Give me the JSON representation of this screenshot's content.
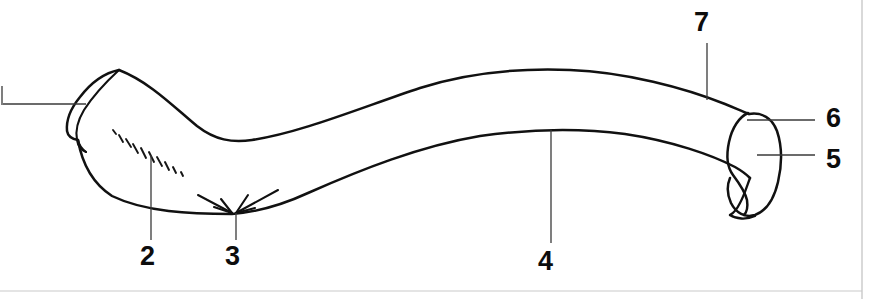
{
  "figure": {
    "kind": "anatomical-line-drawing",
    "background_color": "#ffffff",
    "outline_color": "#111111",
    "leader_color": "#3a3a3a",
    "frame_color": "#c9c9c9",
    "width": 883,
    "height": 299
  },
  "callouts": [
    {
      "id": "1",
      "label": "",
      "x": 0,
      "y": 88,
      "leader": "horizontal",
      "visible_number": false
    },
    {
      "id": "2",
      "label": "2",
      "x": 140,
      "y": 243,
      "leader": "vertical",
      "visible_number": true
    },
    {
      "id": "3",
      "label": "3",
      "x": 225,
      "y": 243,
      "leader": "vertical",
      "visible_number": true
    },
    {
      "id": "4",
      "label": "4",
      "x": 538,
      "y": 248,
      "leader": "vertical",
      "visible_number": true
    },
    {
      "id": "5",
      "label": "5",
      "x": 826,
      "y": 146,
      "leader": "horizontal",
      "visible_number": true
    },
    {
      "id": "6",
      "label": "6",
      "x": 826,
      "y": 105,
      "leader": "horizontal",
      "visible_number": true
    },
    {
      "id": "7",
      "label": "7",
      "x": 694,
      "y": 9,
      "leader": "vertical",
      "visible_number": true
    }
  ],
  "annotations": {
    "hatch_group_count": 9,
    "arrow_count": 2,
    "arrow_target": "3"
  }
}
